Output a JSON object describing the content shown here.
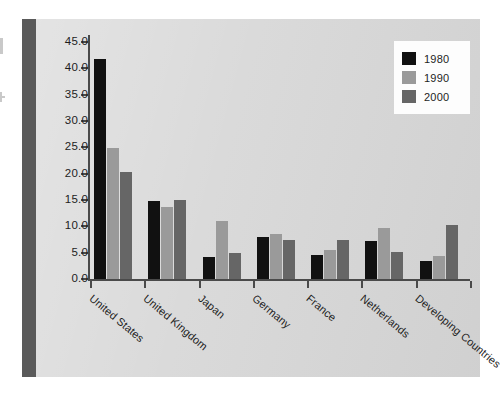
{
  "figure": {
    "background_color": "#d8d8d8",
    "page_color": "#ffffff",
    "binding_color": "#5a5a5a",
    "axis_color": "#4a4a4a"
  },
  "legend": {
    "position": "top-right",
    "background_color": "#fdfdfd",
    "entries": [
      {
        "label": "1980",
        "color": "#111111"
      },
      {
        "label": "1990",
        "color": "#9a9a9a"
      },
      {
        "label": "2000",
        "color": "#666666"
      }
    ]
  },
  "chart_data": {
    "type": "bar",
    "title": "",
    "subtitle": "",
    "xlabel": "",
    "ylabel": "",
    "grid": false,
    "legend_position": "top-right",
    "ylim": [
      0.0,
      45.0
    ],
    "ytick_labels": [
      "0.0",
      "5.0",
      "10.0",
      "15.0",
      "20.0",
      "25.0",
      "30.0",
      "35.0",
      "40.0",
      "45.0"
    ],
    "yticks": [
      0.0,
      5.0,
      10.0,
      15.0,
      20.0,
      25.0,
      30.0,
      35.0,
      40.0,
      45.0
    ],
    "categories": [
      "United States",
      "United Kingdom",
      "Japan",
      "Germany",
      "France",
      "Netherlands",
      "Developing Countries"
    ],
    "series": [
      {
        "name": "1980",
        "color": "#111111",
        "values": [
          41.8,
          14.9,
          4.2,
          8.0,
          4.5,
          7.3,
          3.5
        ]
      },
      {
        "name": "1990",
        "color": "#9a9a9a",
        "values": [
          24.9,
          13.7,
          11.1,
          8.5,
          5.5,
          9.6,
          4.4
        ]
      },
      {
        "name": "2000",
        "color": "#666666",
        "values": [
          20.4,
          15.0,
          5.0,
          7.4,
          7.4,
          5.1,
          10.3
        ]
      }
    ]
  }
}
